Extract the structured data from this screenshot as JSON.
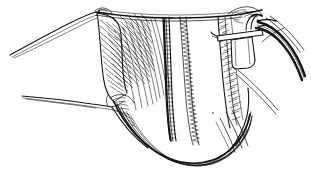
{
  "figure": {
    "kind": "surgical-line-drawing",
    "title": "Surgical line drawing of retracted tissue field with running suture and clamped drain tube",
    "background_color": "#ffffff",
    "ink_color": "#141414",
    "width": 311,
    "height": 178,
    "has_text_labels": false,
    "visible_text": ""
  },
  "elements": {
    "top_edge": {
      "name": "superior wound margin",
      "description": "long near-horizontal dark incision edge spanning the upper field"
    },
    "left_retractor_upper": {
      "name": "upper retractor blade",
      "description": "thin tapering instrument sweeping up and to the left"
    },
    "left_retractor_lower": {
      "name": "lower retractor blade",
      "description": "thin tapering instrument sweeping down and to the left"
    },
    "left_flap": {
      "name": "hatched tissue flap",
      "description": "dense diagonal hatching indicating fibrous tissue on the left"
    },
    "vessel": {
      "name": "vessel with segmental shading",
      "description": "dark beaded vertical structure left of center"
    },
    "suture_line": {
      "name": "running suture line",
      "description": "ladder/zigzag stitch column right of the vessel"
    },
    "right_flap": {
      "name": "right hatched tissue flap",
      "description": "stippled hatching along the right margin"
    },
    "clamp": {
      "name": "tube clamp",
      "description": "rectangular clip holding the drain tube at the upper right"
    },
    "drain_tube": {
      "name": "drain tube",
      "description": "thick double-walled tube curving off the right edge"
    },
    "bottom_margin": {
      "name": "inferior wound margin",
      "description": "nested curved lines forming the lower boundary"
    }
  },
  "palette": {
    "ink": "#141414",
    "background": "#ffffff",
    "mid_gray": "#555555",
    "light_gray": "#9a9a9a"
  }
}
